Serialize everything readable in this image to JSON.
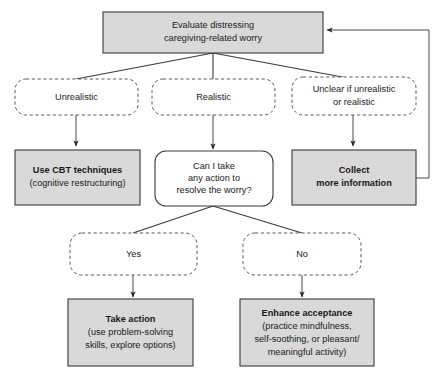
{
  "diagram": {
    "colors": {
      "box_fill": "#d9d9d9",
      "box_stroke": "#3a3a3a",
      "dashed_stroke": "#5a5a5a",
      "canvas": "#ffffff",
      "text": "#1a1a1a"
    },
    "nodes": {
      "evaluate": {
        "line1": "Evaluate distressing",
        "line2": "caregiving-related worry"
      },
      "unrealistic": {
        "line1": "Unrealistic"
      },
      "realistic": {
        "line1": "Realistic"
      },
      "unclear": {
        "line1": "Unclear if unrealistic",
        "line2": "or realistic"
      },
      "cbt": {
        "line1": "Use CBT techniques",
        "line2": "(cognitive restructuring)"
      },
      "question": {
        "line1": "Can I take",
        "line2": "any action to",
        "line3": "resolve the worry?"
      },
      "collect": {
        "line1": "Collect",
        "line2": "more information"
      },
      "yes": {
        "line1": "Yes"
      },
      "no": {
        "line1": "No"
      },
      "take_action": {
        "line1": "Take action",
        "line2": "(use problem-solving",
        "line3": "skills, explore options)"
      },
      "enhance": {
        "line1": "Enhance acceptance",
        "line2": "(practice mindfulness,",
        "line3": "self-soothing, or pleasant/",
        "line4": "meaningful activity)"
      }
    }
  }
}
